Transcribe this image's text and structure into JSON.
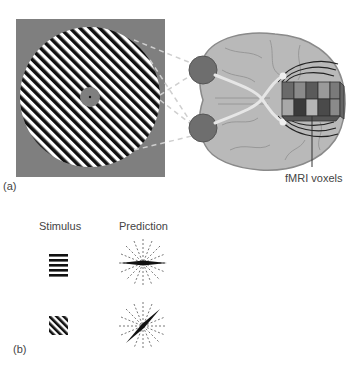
{
  "panel_a": {
    "label": "(a)",
    "voxel_label": "fMRI voxels",
    "colors": {
      "stimulus_background": "#7f7f7f",
      "brain_fill": "#b9b9b9",
      "brain_outline": "#8a8a8a",
      "eye_fill": "#6e6e6e",
      "optic_nerve": "#e6e6e6",
      "voxel_dark": "#4a4a4a",
      "voxel_mid": "#777777",
      "voxel_light": "#a8a8a8"
    }
  },
  "panel_b": {
    "label": "(b)",
    "column_headers": [
      "Stimulus",
      "Prediction"
    ],
    "rows": [
      {
        "stimulus": "horizontal-grating",
        "prediction_orientation_deg": 0
      },
      {
        "stimulus": "oblique-grating",
        "prediction_orientation_deg": 45
      }
    ]
  }
}
